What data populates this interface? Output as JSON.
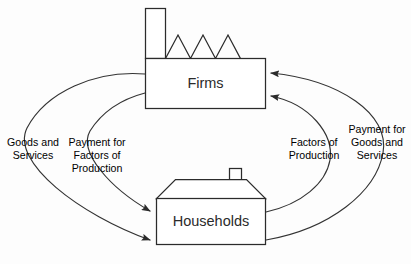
{
  "diagram": {
    "type": "circular-flow",
    "nodes": [
      {
        "id": "firms",
        "label": "Firms",
        "shape": "factory"
      },
      {
        "id": "households",
        "label": "Households",
        "shape": "house"
      }
    ],
    "flows": [
      {
        "id": "goods-and-services",
        "label": "Goods and Services",
        "lines": [
          "Goods and",
          "Services"
        ],
        "from": "firms",
        "to": "households",
        "side": "left",
        "position": "outer"
      },
      {
        "id": "payment-for-factors-of-production",
        "label": "Payment for Factors of Production",
        "lines": [
          "Payment for",
          "Factors of",
          "Production"
        ],
        "from": "firms",
        "to": "households",
        "side": "left",
        "position": "inner"
      },
      {
        "id": "factors-of-production",
        "label": "Factors of Production",
        "lines": [
          "Factors of",
          "Production"
        ],
        "from": "households",
        "to": "firms",
        "side": "right",
        "position": "inner"
      },
      {
        "id": "payment-for-goods-and-services",
        "label": "Payment for Goods and Services",
        "lines": [
          "Payment for",
          "Goods and",
          "Services"
        ],
        "from": "households",
        "to": "firms",
        "side": "right",
        "position": "outer"
      }
    ],
    "colors": {
      "stroke": "#2b2b2b",
      "curve": "#333333",
      "text": "#262626",
      "fill": "#ffffff",
      "background": "#fdfdfd"
    }
  }
}
